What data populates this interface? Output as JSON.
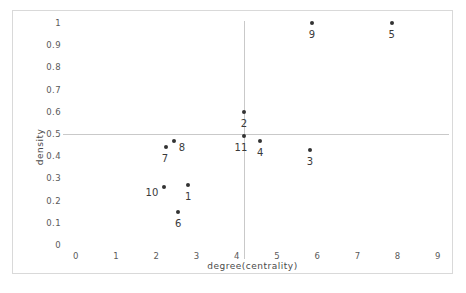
{
  "chart_data": {
    "type": "scatter",
    "title": "",
    "xlabel": "degree(centrality)",
    "ylabel": "density",
    "xlim": [
      0,
      9
    ],
    "ylim": [
      0,
      1
    ],
    "grid": "reference-lines-only",
    "legend": "none",
    "x_ticks": [
      "0",
      "1",
      "2",
      "3",
      "4",
      "5",
      "6",
      "7",
      "8",
      "9"
    ],
    "y_ticks": [
      "0",
      "0.1",
      "0.2",
      "0.3",
      "0.4",
      "0.5",
      "0.6",
      "0.7",
      "0.8",
      "0.9",
      "1"
    ],
    "reference_lines": {
      "horizontal": 0.5,
      "vertical": 4.18
    },
    "points": [
      {
        "label": "1",
        "x": 2.79,
        "y": 0.27,
        "label_dx": 0,
        "label_dy": 6
      },
      {
        "label": "2",
        "x": 4.18,
        "y": 0.6,
        "label_dx": 0,
        "label_dy": 6
      },
      {
        "label": "3",
        "x": 5.82,
        "y": 0.43,
        "label_dx": 0,
        "label_dy": 6
      },
      {
        "label": "4",
        "x": 4.58,
        "y": 0.47,
        "label_dx": 0,
        "label_dy": 6
      },
      {
        "label": "5",
        "x": 7.85,
        "y": 1.0,
        "label_dx": 0,
        "label_dy": 6
      },
      {
        "label": "6",
        "x": 2.54,
        "y": 0.15,
        "label_dx": 0,
        "label_dy": 6
      },
      {
        "label": "7",
        "x": 2.24,
        "y": 0.44,
        "label_dx": -1,
        "label_dy": 6
      },
      {
        "label": "8",
        "x": 2.44,
        "y": 0.47,
        "label_dx": 8,
        "label_dy": 1
      },
      {
        "label": "9",
        "x": 5.87,
        "y": 1.0,
        "label_dx": 0,
        "label_dy": 6
      },
      {
        "label": "10",
        "x": 2.19,
        "y": 0.26,
        "label_dx": -12,
        "label_dy": 0
      },
      {
        "label": "11",
        "x": 4.18,
        "y": 0.49,
        "label_dx": -3,
        "label_dy": 6
      }
    ]
  },
  "colors": {
    "point": "#333333",
    "gridline": "#c9c9c9",
    "frame": "#d9d9d9",
    "text": "#3a3a3a",
    "background": "#ffffff"
  }
}
